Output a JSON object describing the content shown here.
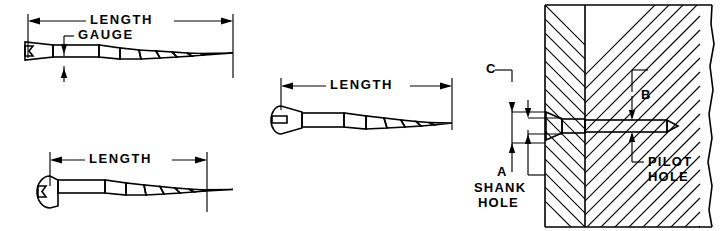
{
  "diagram": {
    "figures": [
      {
        "id": "flat-head-screw",
        "head_type": "flat countersunk head",
        "labels": [
          {
            "name": "length",
            "text": "LENGTH"
          },
          {
            "name": "gauge",
            "text": "GAUGE"
          }
        ]
      },
      {
        "id": "oval-head-screw",
        "head_type": "oval head",
        "labels": [
          {
            "name": "length",
            "text": "LENGTH"
          }
        ]
      },
      {
        "id": "round-head-screw",
        "head_type": "round head",
        "labels": [
          {
            "name": "length",
            "text": "LENGTH"
          }
        ]
      },
      {
        "id": "cross-section",
        "head_type": "flat countersunk head installed",
        "labels": [
          {
            "name": "dimension-c",
            "text": "C"
          },
          {
            "name": "dimension-b",
            "text": "B"
          },
          {
            "name": "dimension-a",
            "text": "A"
          },
          {
            "name": "shank-hole",
            "text": "SHANK\nHOLE"
          },
          {
            "name": "pilot-hole",
            "text": "PILOT\nHOLE"
          }
        ]
      }
    ],
    "labels": {
      "length_1": "LENGTH",
      "gauge": "GAUGE",
      "length_2": "LENGTH",
      "length_3": "LENGTH",
      "dim_c": "C",
      "dim_b": "B",
      "dim_a": "A",
      "shank_hole_line1": "SHANK",
      "shank_hole_line2": "HOLE",
      "pilot_hole_line1": "PILOT",
      "pilot_hole_line2": "HOLE"
    },
    "colors": {
      "line": "#000000",
      "background": "#ffffff",
      "shank_fill": "#b4b4b4",
      "head_fill": "#d9d9d9"
    }
  }
}
